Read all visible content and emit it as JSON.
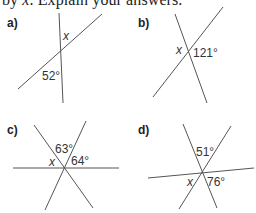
{
  "instruction": {
    "prefix": "by ",
    "variable": "x",
    "suffix": ". Explain your answers."
  },
  "problems": [
    {
      "label": "a)",
      "variable": "x",
      "angles": [
        "52°"
      ]
    },
    {
      "label": "b)",
      "variable": "x",
      "angles": [
        "121°"
      ]
    },
    {
      "label": "c)",
      "variable": "x",
      "angles": [
        "63°",
        "64°"
      ]
    },
    {
      "label": "d)",
      "variable": "x",
      "angles": [
        "51°",
        "76°"
      ]
    }
  ]
}
